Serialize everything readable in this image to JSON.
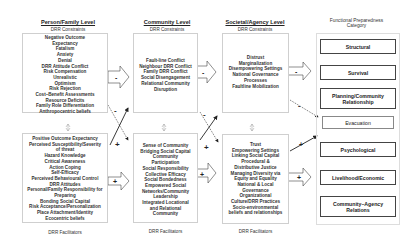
{
  "person_family": {
    "title": "Person/Family Level",
    "constraints_label": "DRR Constraints",
    "constraints": [
      "Negative Outcome",
      "Expectancy",
      "Fatalism",
      "Anxiety",
      "Denial",
      "DRR Attitude Conflict",
      "Risk Compensation",
      "Unrealistic",
      "Optimism",
      "Risk Rejection",
      "Cost–Benefit Assessments",
      "Resource Deficits",
      "Family Role Differentiation",
      "Anthropocentric  beliefs"
    ],
    "facilitators": [
      "Positive Outcome Expectancy",
      "Perceived Susceptibility/Severity",
      "of threat",
      "Hazard Knowledge",
      "Critical Awareness",
      "Action Coping",
      "Self-Efficacy",
      "Perceived Behavioural Control",
      "DRR Attitudes",
      "Personal/Family Responsibility for",
      "Preparing",
      "Bonding Social Capital",
      "Risk Acceptance/Personalization",
      "Place Attachment/Identity",
      "Ecocentric beliefs"
    ],
    "facilitators_label": "DRR Facilitators"
  },
  "community": {
    "title": "Community Level",
    "constraints_label": "DRR Constraints",
    "constraints": [
      "Fault-line Conflict",
      "Neighbour DRR Conflict",
      "Family DRR Conflict",
      "Social Disengagement",
      "Relational Community",
      "Disruption"
    ],
    "facilitators": [
      "Sense of Community",
      "Bridging Social Capital",
      "Community",
      "Participation",
      "Social Responsibility",
      "Collective Efficacy",
      "Social Bondedness",
      "Empowered Social",
      "Networks/Community",
      "Leadership",
      "Integrated Locational",
      "and Relational",
      "Community"
    ],
    "facilitators_label": "DRR Facilitators"
  },
  "societal": {
    "title": "Societal/Agency Level",
    "constraints_label": "DRR Constraints",
    "constraints": [
      "Distrust",
      "Marginalization",
      "Disempowering Settings",
      "National Governance",
      "Processes",
      "Faultline Mobilization"
    ],
    "facilitators": [
      "Trust",
      "Empowering Settings",
      "Linking Social Capital",
      "Procedural &",
      "Distributive Justice",
      "Managing Diversity via",
      "Equity and Equality",
      "National & Local",
      "Governance",
      "Organizational",
      "Culture/DRR Practices",
      "Socio-environmental",
      "beliefs and relationships"
    ],
    "facilitators_label": "DRR Facilitators"
  },
  "categories": {
    "title_line1": "Functional Preparedness",
    "title_line2": "Category",
    "items": [
      "Structural",
      "Survival",
      "Planning/Community Relationship",
      "Evacuation",
      "Psychological",
      "Livelihood/Economic",
      "Community–Agency Relations"
    ]
  },
  "arrows": {
    "minus": "-",
    "plus": "+"
  }
}
